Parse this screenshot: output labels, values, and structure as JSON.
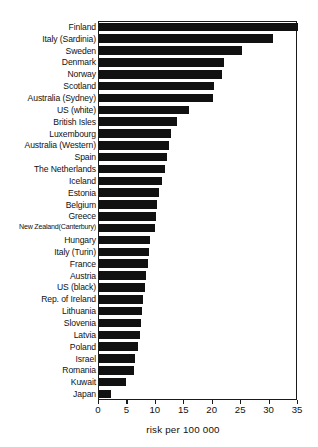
{
  "chart_data": {
    "type": "bar",
    "orientation": "horizontal",
    "title": "",
    "xlabel": "risk per  100 000",
    "ylabel": "",
    "xlim": [
      0,
      35
    ],
    "xticks": [
      0,
      5,
      10,
      15,
      20,
      25,
      30,
      35
    ],
    "xtick_labels": [
      "0",
      "5",
      "10",
      "15",
      "20",
      "25",
      "30",
      "35"
    ],
    "grid": false,
    "legend": null,
    "bar_color": "#111111",
    "frame_color": "#1a1a1a",
    "categories": [
      "Finland",
      "Italy (Sardinia)",
      "Sweden",
      "Denmark",
      "Norway",
      "Scotland",
      "Australia (Sydney)",
      "US (white)",
      "British Isles",
      "Luxembourg",
      "Australia (Western)",
      "Spain",
      "The Netherlands",
      "Iceland",
      "Estonia",
      "Belgium",
      "Greece",
      "New Zealand(Canterbury)",
      "Hungary",
      "Italy (Turin)",
      "France",
      "Austria",
      "US (black)",
      "Rep. of Ireland",
      "Lithuania",
      "Slovenia",
      "Latvia",
      "Poland",
      "Israel",
      "Romania",
      "Kuwait",
      "Japan"
    ],
    "values": [
      35.0,
      30.6,
      25.1,
      21.9,
      21.6,
      20.2,
      20.0,
      15.9,
      13.8,
      12.7,
      12.3,
      12.0,
      11.6,
      11.0,
      10.6,
      10.2,
      10.0,
      9.8,
      9.0,
      8.8,
      8.6,
      8.3,
      8.1,
      7.8,
      7.6,
      7.4,
      7.2,
      6.9,
      6.3,
      6.1,
      4.7,
      2.1
    ]
  }
}
